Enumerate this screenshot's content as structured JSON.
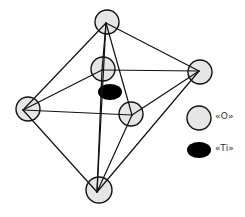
{
  "diagram": {
    "colors": {
      "oxygen_fill": "#e6e6e6",
      "oxygen_stroke": "#111111",
      "titanium_fill": "#000000",
      "bond": "#111111",
      "background": "#ffffff"
    },
    "atoms": [
      {
        "id": "O-top",
        "type": "O",
        "cx": 107,
        "cy": 22,
        "r": 12,
        "vx": 106,
        "vy": 23
      },
      {
        "id": "O-back",
        "type": "O",
        "cx": 103,
        "cy": 69,
        "r": 12,
        "vx": 102,
        "vy": 70
      },
      {
        "id": "O-left",
        "type": "O",
        "cx": 28,
        "cy": 109,
        "r": 12,
        "vx": 23,
        "vy": 110
      },
      {
        "id": "O-right",
        "type": "O",
        "cx": 200,
        "cy": 72,
        "r": 12,
        "vx": 199,
        "vy": 71
      },
      {
        "id": "O-front",
        "type": "O",
        "cx": 131,
        "cy": 114,
        "r": 12,
        "vx": 132,
        "vy": 115
      },
      {
        "id": "O-bottom",
        "type": "O",
        "cx": 99,
        "cy": 190,
        "r": 13,
        "vx": 97,
        "vy": 192
      }
    ],
    "titanium": {
      "id": "Ti-center",
      "type": "Ti",
      "cx": 110,
      "cy": 92,
      "rx": 12,
      "ry": 8
    },
    "bonds": [
      [
        "O-top",
        "O-left"
      ],
      [
        "O-top",
        "O-right"
      ],
      [
        "O-top",
        "O-back"
      ],
      [
        "O-top",
        "O-front"
      ],
      [
        "O-top",
        "O-bottom"
      ],
      [
        "O-bottom",
        "O-left"
      ],
      [
        "O-bottom",
        "O-right"
      ],
      [
        "O-bottom",
        "O-front"
      ],
      [
        "O-back",
        "O-left"
      ],
      [
        "O-back",
        "O-right"
      ],
      [
        "O-left",
        "O-front"
      ],
      [
        "O-front",
        "O-right"
      ],
      [
        "O-back",
        "O-bottom"
      ]
    ]
  },
  "legend": {
    "items": [
      {
        "symbol": "oxygen",
        "label": "«O»",
        "cx": 199,
        "cy": 118,
        "r": 12
      },
      {
        "symbol": "titanium",
        "label": "«Ti»",
        "cx": 199,
        "cy": 150,
        "rx": 12,
        "ry": 8
      }
    ]
  }
}
